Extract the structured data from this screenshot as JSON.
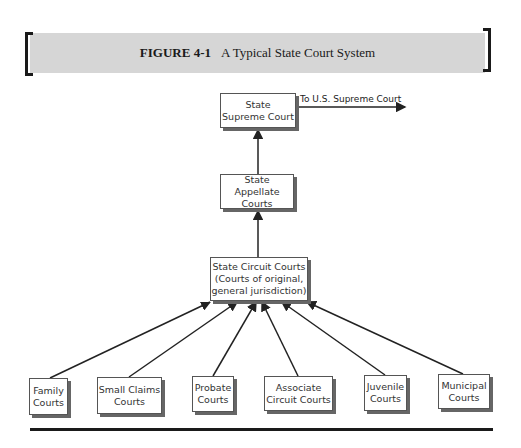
{
  "figure": {
    "number": "FIGURE 4-1",
    "title": "A Typical State Court System"
  },
  "nodes": {
    "supreme": "State\nSupreme Court",
    "appellate": "State Appellate\nCourts",
    "circuit": "State Circuit Courts\n(Courts of original,\ngeneral jurisdiction)",
    "family": "Family\nCourts",
    "small_claims": "Small Claims\nCourts",
    "probate": "Probate\nCourts",
    "associate": "Associate\nCircuit Courts",
    "juvenile": "Juvenile\nCourts",
    "municipal": "Municipal\nCourts"
  },
  "edges": {
    "to_us_supreme": "To U.S. Supreme Court"
  }
}
